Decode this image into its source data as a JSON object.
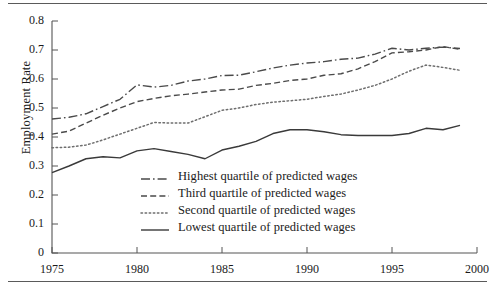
{
  "figure": {
    "rules": {
      "top": "horizontal-rule",
      "bottom": "horizontal-rule"
    }
  },
  "chart_data": {
    "type": "line",
    "title": "",
    "xlabel": "",
    "ylabel": "Employment Rate",
    "xlim": [
      1975,
      2000
    ],
    "ylim": [
      0,
      0.8
    ],
    "grid": false,
    "legend_position": "inside-lower-center",
    "xticks": [
      1975,
      1980,
      1985,
      1990,
      1995,
      2000
    ],
    "xtick_labels": [
      "1975",
      "1980",
      "1985",
      "1990",
      "1995",
      "2000"
    ],
    "yticks": [
      0,
      0.1,
      0.2,
      0.3,
      0.4,
      0.5,
      0.6,
      0.7,
      0.8
    ],
    "ytick_labels": [
      "0",
      "0.1",
      "0.2",
      "0.3",
      "0.4",
      "0.5",
      "0.6",
      "0.7",
      "0.8"
    ],
    "x": [
      1975,
      1976,
      1977,
      1978,
      1979,
      1980,
      1981,
      1982,
      1983,
      1984,
      1985,
      1986,
      1987,
      1988,
      1989,
      1990,
      1991,
      1992,
      1993,
      1994,
      1995,
      1996,
      1997,
      1998,
      1999
    ],
    "series": [
      {
        "name": "Highest quartile of predicted wages",
        "dash": "dashdot",
        "color": "#4a4a4a",
        "values": [
          0.462,
          0.468,
          0.48,
          0.505,
          0.53,
          0.58,
          0.572,
          0.578,
          0.593,
          0.6,
          0.612,
          0.613,
          0.625,
          0.638,
          0.648,
          0.655,
          0.66,
          0.668,
          0.672,
          0.686,
          0.706,
          0.7,
          0.706,
          0.71,
          0.705
        ]
      },
      {
        "name": "Third quartile of predicted wages",
        "dash": "dashed",
        "color": "#4a4a4a",
        "values": [
          0.41,
          0.42,
          0.448,
          0.475,
          0.5,
          0.522,
          0.533,
          0.542,
          0.548,
          0.555,
          0.562,
          0.565,
          0.578,
          0.585,
          0.595,
          0.6,
          0.613,
          0.618,
          0.635,
          0.66,
          0.69,
          0.694,
          0.7,
          0.712,
          0.702
        ]
      },
      {
        "name": "Second quartile of predicted wages",
        "dash": "dotted",
        "color": "#6e6e6e",
        "values": [
          0.363,
          0.365,
          0.372,
          0.39,
          0.41,
          0.43,
          0.45,
          0.448,
          0.448,
          0.47,
          0.492,
          0.5,
          0.512,
          0.52,
          0.525,
          0.53,
          0.54,
          0.548,
          0.562,
          0.578,
          0.6,
          0.627,
          0.648,
          0.64,
          0.63
        ]
      },
      {
        "name": "Lowest quartile of predicted wages",
        "dash": "solid",
        "color": "#3a3a3a",
        "values": [
          0.277,
          0.3,
          0.325,
          0.332,
          0.328,
          0.352,
          0.36,
          0.35,
          0.34,
          0.325,
          0.355,
          0.368,
          0.385,
          0.412,
          0.425,
          0.425,
          0.418,
          0.408,
          0.405,
          0.405,
          0.405,
          0.412,
          0.43,
          0.425,
          0.44
        ]
      }
    ]
  },
  "axis": {
    "ylabel_text": "Employment Rate"
  }
}
